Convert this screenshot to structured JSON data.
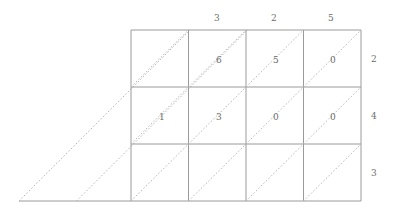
{
  "figure": {
    "name": "triangulated-grid-diagram",
    "background_color": "#ffffff",
    "grid_line_color": "#9a9a9a",
    "diagonal_line_color": "#b8b8b8",
    "text_color": "#6b6b6b",
    "geometry": {
      "grid_left": 131,
      "grid_right": 361,
      "grid_top": 30,
      "grid_bottom": 201,
      "columns": 4,
      "rows": 3,
      "cell_width": 57.5,
      "row_boundaries_y": [
        30,
        87,
        144,
        201
      ],
      "column_boundaries_x": [
        131,
        188.5,
        246,
        303.5,
        361
      ],
      "extension_diagonal_starts_x": [
        19,
        76.5
      ],
      "baseline_left_x": 19
    }
  },
  "column_headers": [
    {
      "label": "",
      "x": 160,
      "y": 18
    },
    {
      "label": "3",
      "x": 217,
      "y": 18
    },
    {
      "label": "2",
      "x": 274,
      "y": 18
    },
    {
      "label": "5",
      "x": 331,
      "y": 18
    }
  ],
  "row_headers": [
    {
      "label": "2",
      "x": 374,
      "y": 59
    },
    {
      "label": "4",
      "x": 374,
      "y": 116
    },
    {
      "label": "3",
      "x": 374,
      "y": 173
    }
  ],
  "cell_values": [
    {
      "label": "",
      "row": 0,
      "col": 0,
      "x": 175,
      "y": 60
    },
    {
      "label": "6",
      "row": 0,
      "col": 1,
      "x": 219,
      "y": 60
    },
    {
      "label": "5",
      "row": 0,
      "col": 2,
      "x": 276,
      "y": 60
    },
    {
      "label": "0",
      "row": 0,
      "col": 3,
      "x": 333,
      "y": 60
    },
    {
      "label": "1",
      "row": 1,
      "col": 0,
      "x": 162,
      "y": 117
    },
    {
      "label": "3",
      "row": 1,
      "col": 1,
      "x": 219,
      "y": 117
    },
    {
      "label": "0",
      "row": 1,
      "col": 2,
      "x": 276,
      "y": 117
    },
    {
      "label": "0",
      "row": 1,
      "col": 3,
      "x": 333,
      "y": 117
    },
    {
      "label": "",
      "row": 2,
      "col": 0,
      "x": 162,
      "y": 174
    },
    {
      "label": "",
      "row": 2,
      "col": 1,
      "x": 219,
      "y": 174
    },
    {
      "label": "",
      "row": 2,
      "col": 2,
      "x": 276,
      "y": 174
    },
    {
      "label": "",
      "row": 2,
      "col": 3,
      "x": 333,
      "y": 174
    }
  ]
}
